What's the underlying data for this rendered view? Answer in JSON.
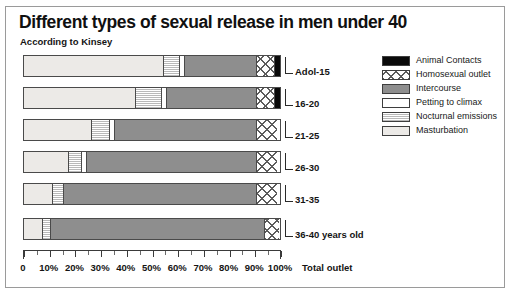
{
  "chart_data": {
    "type": "bar",
    "orientation": "horizontal",
    "stacked": true,
    "title": "Different types of sexual release in men under 40",
    "subtitle": "According to Kinsey",
    "xlabel": "Total outlet",
    "ylabel": "",
    "xlim": [
      0,
      100
    ],
    "grid": false,
    "legend_position": "right",
    "xticklabels": [
      "0",
      "10%",
      "20%",
      "30%",
      "40%",
      "50%",
      "60%",
      "70%",
      "80%",
      "90%",
      "100%"
    ],
    "xtickvalues": [
      0,
      10,
      20,
      30,
      40,
      50,
      60,
      70,
      80,
      90,
      100
    ],
    "categories": [
      "Adol-15",
      "16-20",
      "21-25",
      "26-30",
      "31-35",
      "36-40 years old"
    ],
    "series": [
      {
        "name": "Masturbation",
        "key": "masturbation",
        "values": [
          54,
          43,
          26,
          17,
          11,
          7
        ]
      },
      {
        "name": "Nocturnal emissions",
        "key": "nocturnal",
        "values": [
          6,
          10,
          7,
          5,
          4,
          3
        ]
      },
      {
        "name": "Petting to climax",
        "key": "petting",
        "values": [
          2,
          2,
          2,
          2,
          0,
          0
        ]
      },
      {
        "name": "Intercourse",
        "key": "intercourse",
        "values": [
          28,
          35,
          55,
          66,
          75,
          83
        ]
      },
      {
        "name": "Homosexual outlet",
        "key": "homosexual",
        "values": [
          7,
          7,
          8,
          8,
          8,
          6
        ]
      },
      {
        "name": "Animal Contacts",
        "key": "animal",
        "values": [
          3,
          3,
          0,
          0,
          0,
          0
        ]
      }
    ],
    "colors": {
      "animal": "#0a0a0a",
      "homosexual": "#ffffff",
      "intercourse": "#8e8e8e",
      "petting": "#ffffff",
      "nocturnal": "#e2e2e2",
      "masturbation": "#eceae7"
    }
  },
  "legend": {
    "items": [
      {
        "label": "Animal Contacts",
        "key": "animal"
      },
      {
        "label": "Homosexual outlet",
        "key": "homosexual"
      },
      {
        "label": "Intercourse",
        "key": "intercourse"
      },
      {
        "label": "Petting to climax",
        "key": "petting"
      },
      {
        "label": "Nocturnal emissions",
        "key": "nocturnal"
      },
      {
        "label": "Masturbation",
        "key": "masturbation"
      }
    ]
  }
}
